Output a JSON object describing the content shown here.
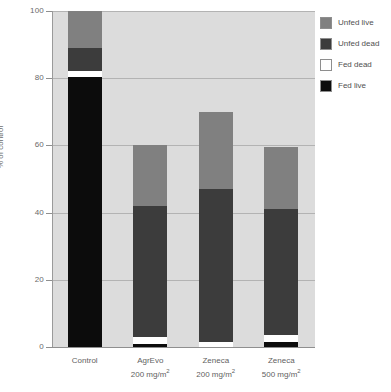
{
  "chart_data": {
    "type": "bar",
    "title": "",
    "subtitle": "",
    "xlabel": "",
    "ylabel": "% of control",
    "ylim": [
      0,
      100
    ],
    "yticks": [
      0,
      20,
      40,
      60,
      80,
      100
    ],
    "grid": true,
    "stacked": true,
    "legend_position": "right",
    "categories": [
      {
        "line1": "Control",
        "line2": "",
        "unit": ""
      },
      {
        "line1": "AgrEvo",
        "line2": "200 mg/m",
        "unit": "2"
      },
      {
        "line1": "Zeneca",
        "line2": "200 mg/m",
        "unit": "2"
      },
      {
        "line1": "Zeneca",
        "line2": "500 mg/m",
        "unit": "2"
      }
    ],
    "category_labels": [
      "Control",
      "AgrEvo 200 mg/m2",
      "Zeneca 200 mg/m2",
      "Zeneca 500 mg/m2"
    ],
    "series": [
      {
        "name": "Fed live",
        "color": "#0c0c0c",
        "values": [
          80.5,
          1.0,
          0.0,
          1.5
        ]
      },
      {
        "name": "Fed dead",
        "color": "#ffffff",
        "values": [
          1.5,
          2.0,
          1.5,
          2.0
        ]
      },
      {
        "name": "Unfed dead",
        "color": "#3c3c3c",
        "values": [
          7.0,
          39.0,
          45.5,
          37.5
        ]
      },
      {
        "name": "Unfed live",
        "color": "#808080",
        "values": [
          11.0,
          18.2,
          23.0,
          18.4
        ]
      }
    ],
    "totals": [
      100,
      60.2,
      70.0,
      59.4
    ]
  },
  "legend": {
    "items": [
      {
        "label": "Unfed live",
        "swatch": "swatch-unfed-live"
      },
      {
        "label": "Unfed dead",
        "swatch": "swatch-unfed-dead"
      },
      {
        "label": "Fed dead",
        "swatch": "swatch-fed-dead"
      },
      {
        "label": "Fed live",
        "swatch": "swatch-fed-live"
      }
    ]
  },
  "colors": {
    "plot_background": "#dcdcdc",
    "gridline": "#b3b3b3",
    "axis": "#8f8f8f",
    "text": "#5f5f5f",
    "unfed_live": "#808080",
    "unfed_dead": "#3c3c3c",
    "fed_dead": "#ffffff",
    "fed_live": "#0c0c0c"
  }
}
